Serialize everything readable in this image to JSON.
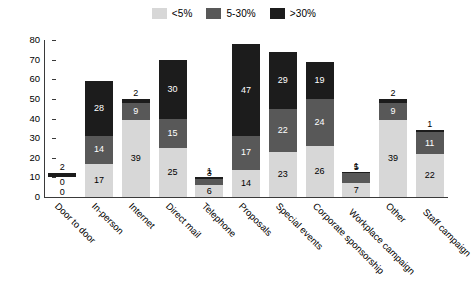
{
  "chart_data": {
    "type": "bar",
    "stacked": true,
    "title": "",
    "xlabel": "",
    "ylabel": "",
    "ylim": [
      0,
      80
    ],
    "ytick_step": 10,
    "yticks": [
      "80",
      "70",
      "60",
      "50",
      "40",
      "30",
      "20",
      "10",
      "0"
    ],
    "grid": false,
    "legend_position": "top-center",
    "categories": [
      "Door to door",
      "In-person",
      "Internet",
      "Direct mail",
      "Telephone",
      "Proposals",
      "Special events",
      "Corporate sponsorship",
      "Workplace campaign",
      "Other",
      "Staff campaign"
    ],
    "series": [
      {
        "name": "<5%",
        "color": "#d7d7d7",
        "values": [
          0,
          17,
          39,
          25,
          6,
          14,
          23,
          26,
          7,
          39,
          22
        ]
      },
      {
        "name": "5-30%",
        "color": "#585858",
        "values": [
          0,
          14,
          9,
          15,
          3,
          17,
          22,
          24,
          5,
          9,
          11
        ]
      },
      {
        "name": ">30%",
        "color": "#1c1c1c",
        "values": [
          2,
          28,
          2,
          30,
          1,
          47,
          29,
          19,
          1,
          2,
          1
        ]
      }
    ],
    "totals": [
      2,
      59,
      50,
      70,
      10,
      78,
      74,
      69,
      13,
      50,
      34
    ]
  },
  "legend": {
    "items": [
      {
        "label": "<5%",
        "color": "#d7d7d7"
      },
      {
        "label": "5-30%",
        "color": "#585858"
      },
      {
        "label": ">30%",
        "color": "#1c1c1c"
      }
    ]
  }
}
